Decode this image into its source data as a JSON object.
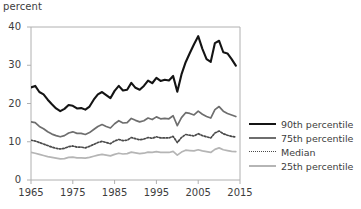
{
  "chart_data": {
    "type": "line",
    "title": "",
    "subtitle": "",
    "unit_label": "percent",
    "xlabel": "",
    "ylabel": "percent",
    "xlim": [
      1965,
      2015
    ],
    "ylim": [
      0,
      40
    ],
    "xticks": [
      1965,
      1975,
      1985,
      1995,
      2005,
      2015
    ],
    "yticks": [
      0,
      10,
      20,
      30,
      40
    ],
    "xtick_labels": [
      "1965",
      "1975",
      "1985",
      "1995",
      "2005",
      "2015"
    ],
    "ytick_labels": [
      "0",
      "10",
      "20",
      "30",
      "40"
    ],
    "grid": false,
    "legend_position": "right",
    "x": [
      1965,
      1966,
      1967,
      1968,
      1969,
      1970,
      1971,
      1972,
      1973,
      1974,
      1975,
      1976,
      1977,
      1978,
      1979,
      1980,
      1981,
      1982,
      1983,
      1984,
      1985,
      1986,
      1987,
      1988,
      1989,
      1990,
      1991,
      1992,
      1993,
      1994,
      1995,
      1996,
      1997,
      1998,
      1999,
      2000,
      2001,
      2002,
      2003,
      2004,
      2005,
      2006,
      2007,
      2008,
      2009,
      2010,
      2011,
      2012,
      2013,
      2014
    ],
    "series": [
      {
        "name": "90th percentile",
        "color": "#141414",
        "style": "solid",
        "width": 2.1,
        "values": [
          24.2,
          24.6,
          23.0,
          22.4,
          21.0,
          19.8,
          18.7,
          18.0,
          18.6,
          19.6,
          19.4,
          18.7,
          18.8,
          18.4,
          19.2,
          21.0,
          22.4,
          23.0,
          22.2,
          21.4,
          23.3,
          24.6,
          23.4,
          23.6,
          25.4,
          24.1,
          23.6,
          24.6,
          26.0,
          25.3,
          26.7,
          25.9,
          26.2,
          26.0,
          27.2,
          23.1,
          27.6,
          30.8,
          33.2,
          35.5,
          37.6,
          34.3,
          31.6,
          30.9,
          35.8,
          36.4,
          33.4,
          33.1,
          31.6,
          29.9
        ]
      },
      {
        "name": "75th percentile",
        "color": "#6e6e6e",
        "style": "solid",
        "width": 1.7,
        "values": [
          15.2,
          15.0,
          14.0,
          13.4,
          12.6,
          12.0,
          11.6,
          11.3,
          11.6,
          12.3,
          12.6,
          12.2,
          12.2,
          11.9,
          12.4,
          13.2,
          14.0,
          14.5,
          14.0,
          13.6,
          14.7,
          15.5,
          14.9,
          15.0,
          16.1,
          15.6,
          15.2,
          15.5,
          16.2,
          15.8,
          16.5,
          16.0,
          16.1,
          16.0,
          16.8,
          14.2,
          16.3,
          17.6,
          17.4,
          17.0,
          18.0,
          17.2,
          16.6,
          16.2,
          18.4,
          19.2,
          18.0,
          17.4,
          17.0,
          16.6
        ]
      },
      {
        "name": "Median",
        "color": "#4a4a4a",
        "style": "dotted",
        "width": 1.7,
        "values": [
          10.4,
          10.2,
          9.8,
          9.4,
          9.0,
          8.6,
          8.3,
          8.1,
          8.3,
          8.7,
          8.9,
          8.6,
          8.6,
          8.4,
          8.8,
          9.3,
          9.8,
          10.1,
          9.8,
          9.5,
          10.2,
          10.6,
          10.3,
          10.4,
          11.1,
          10.8,
          10.5,
          10.7,
          11.1,
          10.9,
          11.3,
          11.0,
          11.0,
          11.0,
          11.4,
          9.8,
          11.1,
          11.9,
          11.7,
          11.5,
          12.1,
          11.6,
          11.3,
          11.0,
          12.3,
          12.8,
          12.1,
          11.7,
          11.4,
          11.2
        ]
      },
      {
        "name": "25th percentile",
        "color": "#b5b5b5",
        "style": "solid",
        "width": 1.7,
        "values": [
          7.2,
          7.0,
          6.7,
          6.4,
          6.1,
          5.9,
          5.7,
          5.5,
          5.6,
          5.9,
          6.0,
          5.8,
          5.8,
          5.7,
          5.9,
          6.2,
          6.5,
          6.7,
          6.5,
          6.3,
          6.7,
          7.0,
          6.8,
          6.9,
          7.3,
          7.1,
          6.9,
          7.0,
          7.3,
          7.2,
          7.4,
          7.2,
          7.2,
          7.2,
          7.5,
          6.5,
          7.3,
          7.8,
          7.7,
          7.6,
          7.9,
          7.6,
          7.4,
          7.2,
          8.0,
          8.4,
          7.9,
          7.7,
          7.5,
          7.4
        ]
      }
    ],
    "legend": [
      {
        "label": "90th percentile",
        "color": "#141414",
        "style": "solid",
        "width": 2.6
      },
      {
        "label": "75th percentile",
        "color": "#6e6e6e",
        "style": "solid",
        "width": 1.9
      },
      {
        "label": "Median",
        "color": "#4a4a4a",
        "style": "dotted",
        "width": 1.9
      },
      {
        "label": "25th percentile",
        "color": "#b5b5b5",
        "style": "solid",
        "width": 1.9
      }
    ],
    "plot_frame_color": "#b0b0b0"
  }
}
